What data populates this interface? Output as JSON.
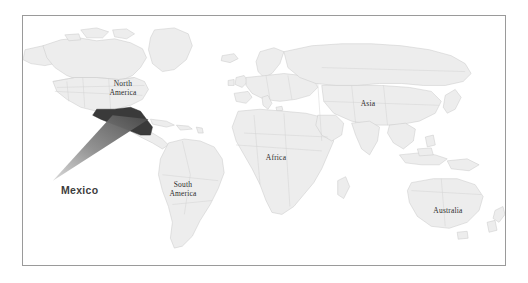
{
  "figure": {
    "type": "world-map",
    "frame": {
      "border_color": "#9a9a9a",
      "background": "#ffffff"
    }
  },
  "colors": {
    "land_fill": "#ededed",
    "land_stroke": "#c9c9c9",
    "ocean": "#ffffff",
    "highlight_fill": "#3a3a3a",
    "callout_fill": "#6e6e6e",
    "label_text": "#2b2b2b",
    "callout_text": "#3d3d3d",
    "frame_border": "#9a9a9a"
  },
  "map": {
    "continent_labels": [
      {
        "id": "north-america",
        "text": "North\nAmerica"
      },
      {
        "id": "south-america",
        "text": "South\nAmerica"
      },
      {
        "id": "africa",
        "text": "Africa"
      },
      {
        "id": "asia",
        "text": "Asia"
      },
      {
        "id": "australia",
        "text": "Australia"
      }
    ],
    "highlighted_country": "Mexico",
    "callout": {
      "label": "Mexico",
      "shape": "gradient-cone",
      "points_to": "Mexico"
    }
  }
}
